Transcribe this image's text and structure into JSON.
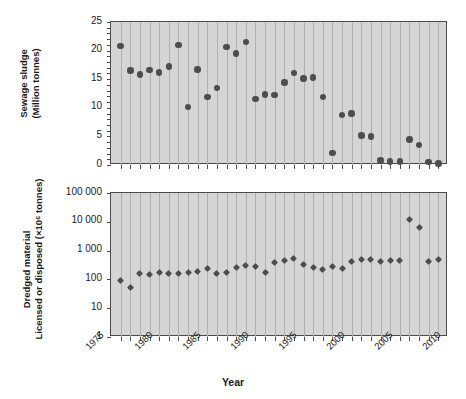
{
  "chart_data": [
    {
      "type": "scatter",
      "panel": "top",
      "title": "",
      "xlabel": "Year",
      "ylabel": "Sewage sludge (Million tonnes)",
      "ylabel_lines": [
        "Sewage sludge",
        "(Million tonnes)"
      ],
      "yscale": "linear",
      "ylim": [
        0,
        25
      ],
      "yticks": [
        0,
        5,
        10,
        15,
        20,
        25
      ],
      "ytick_labels": [
        "0",
        "5",
        "10",
        "15",
        "20",
        "25"
      ],
      "xlim": [
        1976,
        2011
      ],
      "xticks": [
        1975,
        1980,
        1985,
        1990,
        1995,
        2000,
        2005,
        2010
      ],
      "xtick_labels": [
        "1975",
        "1980",
        "1985",
        "1990",
        "1995",
        "2000",
        "2005",
        "2010"
      ],
      "grid": "vertical",
      "marker": "circle",
      "x": [
        1977,
        1978,
        1979,
        1980,
        1981,
        1982,
        1983,
        1984,
        1985,
        1986,
        1987,
        1988,
        1989,
        1990,
        1991,
        1992,
        1993,
        1994,
        1995,
        1996,
        1997,
        1998,
        1999,
        2000,
        2001,
        2002,
        2003,
        2004,
        2005,
        2006,
        2007,
        2008,
        2009,
        2010
      ],
      "values": [
        20.8,
        16.5,
        15.8,
        16.6,
        16.2,
        17.2,
        21.0,
        10.1,
        16.7,
        11.9,
        13.5,
        20.6,
        19.5,
        21.5,
        11.5,
        12.3,
        12.2,
        14.4,
        16.1,
        15.1,
        15.3,
        11.9,
        2.1,
        8.7,
        9.0,
        5.2,
        5.0,
        0.8,
        0.6,
        0.6,
        4.5,
        3.5,
        0.5,
        0.3
      ]
    },
    {
      "type": "scatter",
      "panel": "bottom",
      "title": "",
      "xlabel": "Year",
      "ylabel": "Dredged material Licensed or disposed (×10⁶ tonnes)",
      "ylabel_lines": [
        "Dredged material",
        "Licensed or disposed (×10⁶ tonnes)"
      ],
      "yscale": "log",
      "ylim": [
        1,
        100000
      ],
      "yticks": [
        1,
        10,
        100,
        1000,
        10000,
        100000
      ],
      "ytick_labels": [
        "1",
        "10",
        "100",
        "1 000",
        "10 000",
        "100 000"
      ],
      "xlim": [
        1976,
        2011
      ],
      "xticks": [
        1975,
        1980,
        1985,
        1990,
        1995,
        2000,
        2005,
        2010
      ],
      "xtick_labels": [
        "1975",
        "1980",
        "1985",
        "1990",
        "1995",
        "2000",
        "2005",
        "2010"
      ],
      "grid": "vertical",
      "marker": "diamond",
      "x": [
        1977,
        1978,
        1979,
        1980,
        1981,
        1982,
        1983,
        1984,
        1985,
        1986,
        1987,
        1988,
        1989,
        1990,
        1991,
        1992,
        1993,
        1994,
        1995,
        1996,
        1997,
        1998,
        1999,
        2000,
        2001,
        2002,
        2003,
        2004,
        2005,
        2006,
        2007,
        2008,
        2009,
        2010
      ],
      "values": [
        90,
        52,
        160,
        150,
        180,
        160,
        165,
        180,
        185,
        230,
        160,
        175,
        260,
        310,
        290,
        175,
        390,
        440,
        520,
        330,
        260,
        215,
        290,
        230,
        420,
        500,
        480,
        430,
        440,
        450,
        12000,
        6500,
        430,
        480
      ]
    }
  ],
  "axis": {
    "x_title": "Year"
  },
  "colors": {
    "plot_background": "#d5d5d5",
    "gridline": "#b0b0b0",
    "marker": "#4d4d4d",
    "axis": "#4a4a4a",
    "text": "#1a1a1a",
    "page_background": "#ffffff"
  }
}
